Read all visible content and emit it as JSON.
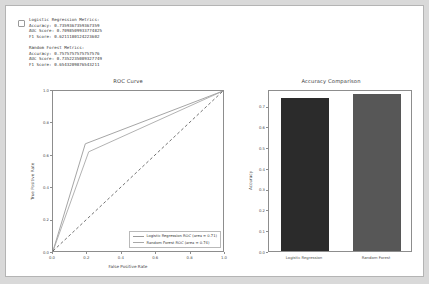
{
  "notebook_output": {
    "marker": "output-marker",
    "metrics_lines_group_1": [
      "Logistic Regression Metrics:",
      "Accuracy: 0.7359367359367359",
      "AUC Score: 0.7098509933774825",
      "F1 Score: 0.6211180124223602"
    ],
    "metrics_lines_group_2": [
      "Random Forest Metrics:",
      "Accuracy: 0.7575757575757576",
      "AUC Score: 0.7352235089327749",
      "F1 Score: 0.6543209876543211"
    ]
  },
  "chart_data": [
    {
      "type": "line",
      "title": "ROC Curve",
      "xlabel": "False Positive Rate",
      "ylabel": "True Positive Rate",
      "xlim": [
        0.0,
        1.0
      ],
      "ylim": [
        0.0,
        1.0
      ],
      "grid": false,
      "legend_position": "lower right",
      "xticks": [
        "0.0",
        "0.2",
        "0.4",
        "0.6",
        "0.8",
        "1.0"
      ],
      "xtick_values": [
        0.0,
        0.2,
        0.4,
        0.6,
        0.8,
        1.0
      ],
      "yticks": [
        "0.0",
        "0.2",
        "0.4",
        "0.6",
        "0.8",
        "1.0"
      ],
      "ytick_values": [
        0.0,
        0.2,
        0.4,
        0.6,
        0.8,
        1.0
      ],
      "series": [
        {
          "name": "Logistic Regression ROC (area = 0.71)",
          "color": "#9a9a9a",
          "style": "solid",
          "x": [
            0.0,
            0.19,
            1.0
          ],
          "y": [
            0.0,
            0.67,
            1.0
          ]
        },
        {
          "name": "Random Forest ROC (area = 0.74)",
          "color": "#a8a8a8",
          "style": "solid",
          "x": [
            0.0,
            0.21,
            1.0
          ],
          "y": [
            0.0,
            0.62,
            1.0
          ]
        },
        {
          "name": "chance-reference",
          "color": "#4d4d4d",
          "style": "dashed",
          "x": [
            0.0,
            1.0
          ],
          "y": [
            0.0,
            1.0
          ]
        }
      ]
    },
    {
      "type": "bar",
      "title": "Accuracy Comparison",
      "xlabel": "",
      "ylabel": "Accuracy",
      "categories": [
        "Logistic Regression",
        "Random Forest"
      ],
      "values": [
        0.7359367359367359,
        0.7575757575757576
      ],
      "colors": [
        "#2b2b2b",
        "#575757"
      ],
      "ylim": [
        0.0,
        0.78
      ],
      "grid": false,
      "yticks": [
        "0.0",
        "0.1",
        "0.2",
        "0.3",
        "0.4",
        "0.5",
        "0.6",
        "0.7"
      ],
      "ytick_values": [
        0.0,
        0.1,
        0.2,
        0.3,
        0.4,
        0.5,
        0.6,
        0.7
      ]
    }
  ]
}
